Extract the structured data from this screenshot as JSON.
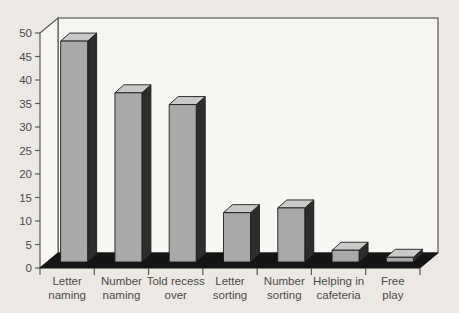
{
  "figure": {
    "kind": "scanned textbook bar chart figure",
    "background": "#ece9e4"
  },
  "chart_data": {
    "type": "bar",
    "style": "3d-column",
    "title": "",
    "xlabel": "",
    "ylabel": "",
    "legend": "none",
    "grid": false,
    "categories": [
      {
        "label": "Letter naming",
        "lines": [
          "Letter",
          "naming"
        ]
      },
      {
        "label": "Number naming",
        "lines": [
          "Number",
          "naming"
        ]
      },
      {
        "label": "Told recess over",
        "lines": [
          "Told recess",
          "over"
        ]
      },
      {
        "label": "Letter sorting",
        "lines": [
          "Letter",
          "sorting"
        ]
      },
      {
        "label": "Number sorting",
        "lines": [
          "Number",
          "sorting"
        ]
      },
      {
        "label": "Helping in cafeteria",
        "lines": [
          "Helping in",
          "cafeteria"
        ]
      },
      {
        "label": "Free play",
        "lines": [
          "Free",
          "play"
        ]
      }
    ],
    "values": [
      47,
      36,
      33.5,
      10.5,
      11.5,
      2.5,
      1
    ],
    "ylim": [
      0,
      50
    ],
    "ytick_step": 5,
    "ytick_labels": [
      "0",
      "5",
      "10",
      "15",
      "20",
      "25",
      "30",
      "35",
      "40",
      "45",
      "50"
    ],
    "colors": {
      "bar_front": "#a9a9a9",
      "bar_top": "#c9c9c7",
      "bar_side": "#2d2d2d",
      "bar_outline": "#1d1d1d",
      "floor": "#141414",
      "wall_fill": "#f7f6f3",
      "wall_stroke": "#5a5a5a",
      "axis_text": "#4b4b4b",
      "background": "#ece9e4"
    }
  }
}
